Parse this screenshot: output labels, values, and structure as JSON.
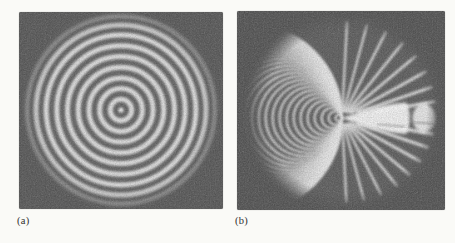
{
  "page": {
    "background_color": "#fafaf7"
  },
  "figure": {
    "panel_a": {
      "label": "(a)",
      "description": "interferogram photo with concentric circular fringes",
      "square_bg": "#666666",
      "fringe_color": "#e7e7e7",
      "vignette_color": "#5c5c5c",
      "center": {
        "x": 102,
        "y": 98
      },
      "center_dot_radius": 2.6,
      "ring_radii": [
        10.7,
        21.4,
        32.1,
        42.8,
        53.5,
        64.2,
        74.9,
        85.3,
        94.6
      ],
      "ring_stroke_width": 5,
      "beam": {
        "cx": 102,
        "cy": 98,
        "r": 103
      }
    },
    "panel_b": {
      "label": "(b)",
      "description": "interferogram photo with fringes converging to a bright vertex",
      "square_bg": "#616161",
      "fringe_color": "#e4e4e4",
      "vignette_color": "#585858",
      "vertex": {
        "x": 105,
        "y": 107
      },
      "arcs": {
        "r_start": 3.2,
        "r_step": 3.5,
        "count": 27,
        "stroke_width": 2.3,
        "opacity": 0.85
      },
      "rays": {
        "angles_deg": [
          87,
          75,
          63,
          51,
          40,
          29,
          19,
          10
        ],
        "widths": [
          2.4,
          2.4,
          2.6,
          2.8,
          3.0,
          3.2,
          3.4,
          3.6
        ],
        "start_offsets": [
          7,
          7,
          7,
          8,
          9,
          11,
          17,
          36
        ]
      },
      "wedge": {
        "tip_x": 105,
        "tip_y": 107,
        "right_x": 169,
        "top_y": 91.5,
        "bottom_y": 123,
        "color": "#f3f3f3"
      },
      "notch": {
        "x": 172.5,
        "y1": 92,
        "y2": 123,
        "width": 5
      },
      "oval": {
        "cx": 187,
        "cy": 107,
        "rx": 11.5,
        "ry": 14.5,
        "color": "#efefef"
      },
      "dark_streaks": [
        {
          "x1": 140,
          "y1": 113,
          "x2": 168,
          "y2": 116
        },
        {
          "x1": 176,
          "y1": 111,
          "x2": 197,
          "y2": 113
        }
      ],
      "beam": {
        "cx": 108,
        "cy": 101,
        "r": 102
      }
    }
  }
}
